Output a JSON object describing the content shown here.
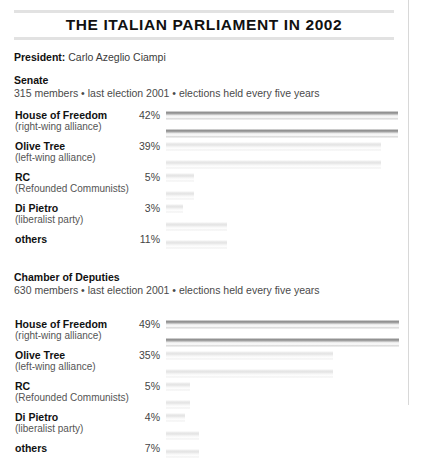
{
  "document": {
    "title": "THE ITALIAN PARLIAMENT IN 2002",
    "president_label": "President:",
    "president_name": "Carlo Azeglio Ciampi"
  },
  "sections": [
    {
      "heading": "Senate",
      "subheading": "315 members • last election 2001 • elections held every five years"
    },
    {
      "heading": "Chamber of Deputies",
      "subheading": "630 members • last election 2001 • elections held every five years"
    }
  ],
  "chart_data": [
    {
      "type": "bar",
      "title": "Senate",
      "subtitle": "315 members • last election 2001 • elections held every five years",
      "orientation": "horizontal",
      "categories": [
        "House of Freedom",
        "Olive Tree",
        "RC",
        "Di Pietro",
        "others"
      ],
      "sublabels": [
        "(right-wing alliance)",
        "(left-wing alliance)",
        "(Refounded Communists)",
        "(liberalist party)",
        ""
      ],
      "values": [
        42,
        39,
        5,
        3,
        11
      ],
      "value_labels": [
        "42%",
        "39%",
        "5%",
        "3%",
        "11%"
      ],
      "xlabel": "",
      "ylabel": "",
      "xlim": [
        0,
        44
      ],
      "grid": false,
      "legend": "none",
      "unit": "%"
    },
    {
      "type": "bar",
      "title": "Chamber of Deputies",
      "subtitle": "630 members • last election 2001 • elections held every five years",
      "orientation": "horizontal",
      "categories": [
        "House of Freedom",
        "Olive Tree",
        "RC",
        "Di Pietro",
        "others"
      ],
      "sublabels": [
        "(right-wing alliance)",
        "(left-wing alliance)",
        "(Refounded Communists)",
        "(liberalist party)",
        ""
      ],
      "values": [
        49,
        35,
        5,
        4,
        7
      ],
      "value_labels": [
        "49%",
        "35%",
        "5%",
        "4%",
        "7%"
      ],
      "xlabel": "",
      "ylabel": "",
      "xlim": [
        0,
        51
      ],
      "grid": false,
      "legend": "none",
      "unit": "%"
    }
  ],
  "style": {
    "bar_dark": "#8e8e8e",
    "bar_light": "#e3e3e3",
    "rule_color": "#e2e2e2",
    "text_color": "#111111"
  }
}
